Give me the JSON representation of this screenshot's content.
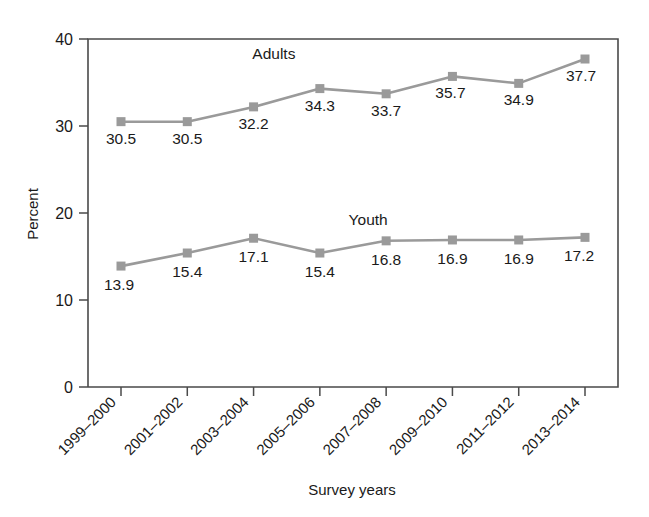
{
  "chart_data": {
    "type": "line",
    "title": "",
    "subtitle": "",
    "xlabel": "Survey years",
    "ylabel": "Percent",
    "categories": [
      "1999–2000",
      "2001–2002",
      "2003–2004",
      "2005–2006",
      "2007–2008",
      "2009–2010",
      "2011–2012",
      "2013–2014"
    ],
    "ylim": [
      0,
      40
    ],
    "yticks": [
      "0",
      "10",
      "20",
      "30",
      "40"
    ],
    "ytick_values": [
      0,
      10,
      20,
      30,
      40
    ],
    "grid": false,
    "legend_position": "inline-annotation",
    "series": [
      {
        "name": "Adults",
        "color": "#9a9a9a",
        "values": [
          30.5,
          30.5,
          32.2,
          34.3,
          33.7,
          35.7,
          34.9,
          37.7
        ],
        "labels": [
          "30.5",
          "30.5",
          "32.2",
          "34.3",
          "33.7",
          "35.7",
          "34.9",
          "37.7"
        ]
      },
      {
        "name": "Youth",
        "color": "#9a9a9a",
        "values": [
          13.9,
          15.4,
          17.1,
          15.4,
          16.8,
          16.9,
          16.9,
          17.2
        ],
        "labels": [
          "13.9",
          "15.4",
          "17.1",
          "15.4",
          "16.8",
          "16.9",
          "16.9",
          "17.2"
        ]
      }
    ],
    "annotations": [
      {
        "text": "Adults",
        "series": "Adults"
      },
      {
        "text": "Youth",
        "series": "Youth"
      }
    ]
  },
  "colors": {
    "series": "#9a9a9a",
    "axis": "#4a4a4a",
    "text": "#1a1a1a",
    "background": "#ffffff"
  }
}
